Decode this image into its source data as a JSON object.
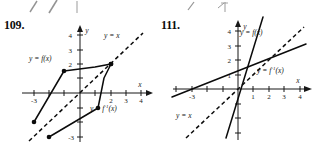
{
  "figures": [
    {
      "id": "fig-109",
      "number": "109.",
      "axis": {
        "x_label": "x",
        "y_label": "y",
        "x_ticks": [
          {
            "value": -3,
            "label": "-3"
          },
          {
            "value": -2,
            "label": ""
          },
          {
            "value": -1,
            "label": ""
          },
          {
            "value": 1,
            "label": ""
          },
          {
            "value": 2,
            "label": "2"
          },
          {
            "value": 3,
            "label": "3"
          },
          {
            "value": 4,
            "label": "4"
          }
        ],
        "y_ticks": [
          {
            "value": 4,
            "label": "4"
          },
          {
            "value": 3,
            "label": "3"
          },
          {
            "value": 2,
            "label": "2"
          },
          {
            "value": 1,
            "label": ""
          },
          {
            "value": -1,
            "label": ""
          },
          {
            "value": -2,
            "label": ""
          },
          {
            "value": -3,
            "label": "-3"
          }
        ]
      },
      "curves": [
        {
          "name": "f",
          "label": "y = f(x)",
          "type": "polyline",
          "points": [
            [
              -3,
              -2
            ],
            [
              -1,
              1.5
            ],
            [
              1,
              1.8
            ],
            [
              2,
              2
            ]
          ]
        },
        {
          "name": "f-inverse",
          "label": "y = f",
          "label_sup": "-1",
          "label_tail": "(x)",
          "type": "polyline",
          "points": [
            [
              -2,
              -3
            ],
            [
              1.5,
              -1
            ],
            [
              1.8,
              1
            ],
            [
              2,
              2
            ]
          ]
        },
        {
          "name": "identity",
          "label": "y = x",
          "type": "dashed-line",
          "points": [
            [
              -3.3,
              -3.3
            ],
            [
              4.1,
              4.1
            ]
          ]
        }
      ],
      "curve_labels": [
        {
          "name": "f-label",
          "text": "y = f(x)"
        },
        {
          "name": "f-inverse-label",
          "text_pre": "y = f",
          "sup": "-1",
          "text_post": "(x)"
        },
        {
          "name": "identity-label",
          "text": "y = x"
        }
      ]
    },
    {
      "id": "fig-111",
      "number": "111.",
      "axis": {
        "x_label": "x",
        "y_label": "y",
        "x_ticks": [
          {
            "value": -4,
            "label": ""
          },
          {
            "value": -3,
            "label": "-3"
          },
          {
            "value": -2,
            "label": ""
          },
          {
            "value": -1,
            "label": ""
          },
          {
            "value": 1,
            "label": "1"
          },
          {
            "value": 2,
            "label": "2"
          },
          {
            "value": 3,
            "label": "3"
          },
          {
            "value": 4,
            "label": "4"
          }
        ],
        "y_ticks": [
          {
            "value": 4,
            "label": "4"
          },
          {
            "value": 3,
            "label": "3"
          },
          {
            "value": 2,
            "label": "2"
          },
          {
            "value": 1,
            "label": "1"
          },
          {
            "value": -1,
            "label": ""
          },
          {
            "value": -2,
            "label": ""
          },
          {
            "value": -3,
            "label": ""
          }
        ]
      },
      "curves": [
        {
          "name": "f",
          "label": "y = f(x)",
          "type": "line",
          "points": [
            [
              -0.75,
              -3.4
            ],
            [
              1.6,
              5.0
            ]
          ]
        },
        {
          "name": "f-inverse",
          "label": "y = f",
          "label_sup": "-1",
          "label_tail": "(x)",
          "type": "line",
          "points": [
            [
              -4.3,
              -0.55
            ],
            [
              4.4,
              3.1
            ]
          ]
        },
        {
          "name": "identity",
          "label": "y = x",
          "type": "dashed-line",
          "points": [
            [
              -3.4,
              -3.4
            ],
            [
              4.3,
              4.3
            ]
          ]
        }
      ],
      "curve_labels": [
        {
          "name": "f-label",
          "text": "y = f(x)"
        },
        {
          "name": "f-inverse-label",
          "text_pre": "y = f",
          "sup": "-1",
          "text_post": "(x)"
        },
        {
          "name": "identity-label",
          "text": "y = x"
        }
      ]
    }
  ]
}
